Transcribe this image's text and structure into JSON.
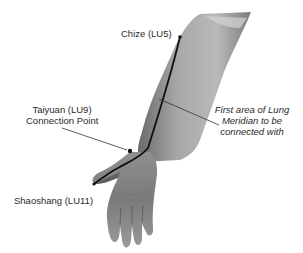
{
  "diagram": {
    "points": [
      {
        "id": "lu5",
        "name": "Chize (LU5)"
      },
      {
        "id": "lu9",
        "name": "Taiyuan (LU9)",
        "note": "Connection Point"
      },
      {
        "id": "lu11",
        "name": "Shaoshang (LU11)"
      }
    ],
    "callout": {
      "line1": "First area of Lung",
      "line2": "Meridian to be",
      "line3": "connected with"
    },
    "colors": {
      "background": "#ffffff",
      "skin_light": "#c9c9c9",
      "skin_mid": "#9a9a9a",
      "skin_dark": "#5e5e5e",
      "meridian_line": "#111111",
      "leader_line": "#333333",
      "text": "#2a2a2a"
    }
  }
}
